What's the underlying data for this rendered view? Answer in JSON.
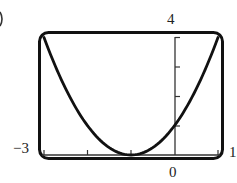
{
  "figure_label_fragment": ")",
  "labels": {
    "ymax": "4",
    "xmin": "−3",
    "xmax": "1",
    "origin": "0"
  },
  "chart_data": {
    "type": "line",
    "title": "",
    "function": "y = (x + 1)^2",
    "xlabel": "",
    "ylabel": "",
    "xlim": [
      -3,
      1
    ],
    "ylim": [
      0,
      4
    ],
    "x_ticks": [
      -3,
      -2,
      -1,
      0,
      1
    ],
    "y_ticks": [
      0,
      1,
      2,
      3,
      4
    ],
    "tick_labels": {
      "x": [
        "-3",
        "0",
        "1"
      ],
      "y": [
        "4"
      ]
    },
    "grid": false,
    "legend": null,
    "series": [
      {
        "name": "parabola",
        "x": [
          -3,
          -2.5,
          -2,
          -1.5,
          -1,
          -0.5,
          0,
          0.5,
          1
        ],
        "y": [
          4,
          2.25,
          1,
          0.25,
          0,
          0.25,
          1,
          2.25,
          4
        ]
      }
    ],
    "vertex": [
      -1,
      0
    ],
    "y_intercept": 1
  }
}
